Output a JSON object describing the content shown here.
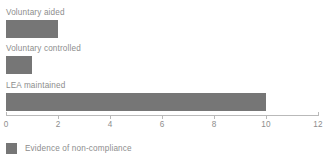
{
  "chart_data": {
    "type": "bar",
    "orientation": "horizontal",
    "title": "",
    "subtitle": "",
    "xlabel": "",
    "ylabel": "",
    "categories": [
      "Voluntary aided",
      "Voluntary controlled",
      "LEA maintained"
    ],
    "values": [
      2,
      1,
      10
    ],
    "series": [
      {
        "name": "Evidence of non-compliance",
        "values": [
          2,
          1,
          10
        ],
        "color": "#767676"
      }
    ],
    "xlim": [
      0,
      12
    ],
    "xticks": [
      0,
      2,
      4,
      6,
      8,
      10,
      12
    ],
    "xtick_labels": [
      "0",
      "2",
      "4",
      "6",
      "8",
      "10",
      "12"
    ],
    "grid": false,
    "legend": {
      "position": "bottom-left",
      "entries": [
        {
          "label": "Evidence of non-compliance",
          "color": "#767676"
        }
      ]
    },
    "colors": {
      "bar": "#767676",
      "text": "#8d8d8d",
      "axis": "#b9b9b9",
      "background": "#ffffff"
    }
  }
}
